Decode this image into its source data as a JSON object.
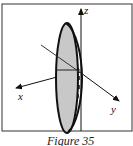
{
  "figure": {
    "caption": "Figure 35",
    "axes": {
      "x_label": "x",
      "y_label": "y",
      "z_label": "z"
    },
    "shape": "ellipse-disk",
    "colors": {
      "fill": "#c8c8c8",
      "stroke": "#111111",
      "background": "#ffffff"
    }
  }
}
